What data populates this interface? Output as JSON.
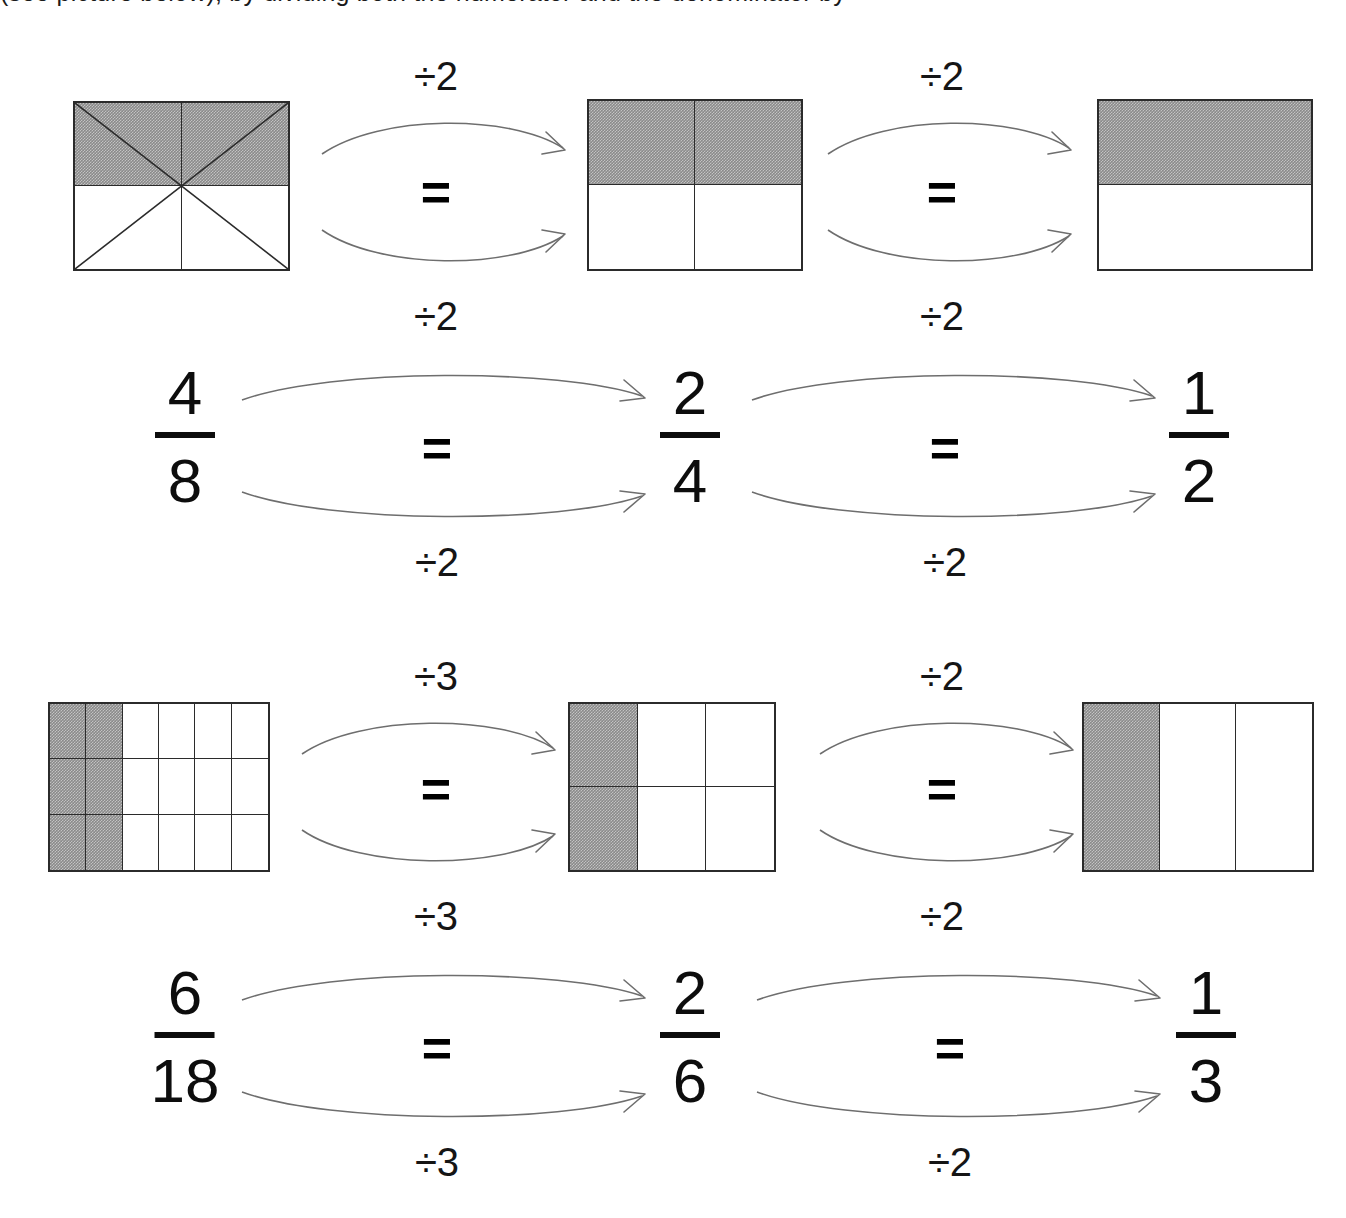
{
  "header": {
    "clipped_text": "(see picture below), by dividing both the numerator and the denominator by"
  },
  "rows": [
    {
      "id": "row-1",
      "shape_models": [
        {
          "name": "eighths-model",
          "fraction_label": "4/8",
          "cols": 2,
          "rows": 2,
          "shaded_cells": [
            0,
            1
          ],
          "diagonals": true,
          "numerator": 4,
          "denominator": 8
        },
        {
          "name": "fourths-model",
          "fraction_label": "2/4",
          "cols": 2,
          "rows": 2,
          "shaded_cells": [
            0,
            1
          ],
          "diagonals": false,
          "numerator": 2,
          "denominator": 4
        },
        {
          "name": "halves-model",
          "fraction_label": "1/2",
          "cols": 1,
          "rows": 2,
          "shaded_cells": [
            0
          ],
          "diagonals": false,
          "numerator": 1,
          "denominator": 2
        }
      ],
      "shape_transitions": [
        {
          "top_label": "÷2",
          "equals": "=",
          "bottom_label": "÷2"
        },
        {
          "top_label": "÷2",
          "equals": "=",
          "bottom_label": "÷2"
        }
      ],
      "fractions": [
        {
          "numerator": "4",
          "denominator": "8"
        },
        {
          "numerator": "2",
          "denominator": "4"
        },
        {
          "numerator": "1",
          "denominator": "2"
        }
      ],
      "fraction_transitions": [
        {
          "top_label": "÷2",
          "equals": "=",
          "bottom_label": "÷2"
        },
        {
          "top_label": "÷2",
          "equals": "=",
          "bottom_label": "÷2"
        }
      ]
    },
    {
      "id": "row-2",
      "shape_models": [
        {
          "name": "eighteenths-model",
          "fraction_label": "6/18",
          "cols": 6,
          "rows": 3,
          "shaded_cols": 2,
          "diagonals": false,
          "numerator": 6,
          "denominator": 18
        },
        {
          "name": "sixths-model",
          "fraction_label": "2/6",
          "cols": 3,
          "rows": 2,
          "shaded_cols": 1,
          "diagonals": false,
          "numerator": 2,
          "denominator": 6
        },
        {
          "name": "thirds-model",
          "fraction_label": "1/3",
          "cols": 3,
          "rows": 1,
          "shaded_cols": 1,
          "diagonals": false,
          "numerator": 1,
          "denominator": 3
        }
      ],
      "shape_transitions": [
        {
          "top_label": "÷3",
          "equals": "=",
          "bottom_label": "÷3"
        },
        {
          "top_label": "÷2",
          "equals": "=",
          "bottom_label": "÷2"
        }
      ],
      "fractions": [
        {
          "numerator": "6",
          "denominator": "18"
        },
        {
          "numerator": "2",
          "denominator": "6"
        },
        {
          "numerator": "1",
          "denominator": "3"
        }
      ],
      "fraction_transitions": [
        {
          "top_label": "÷3",
          "equals": "=",
          "bottom_label": "÷3"
        },
        {
          "top_label": "÷2",
          "equals": "=",
          "bottom_label": "÷2"
        }
      ]
    }
  ],
  "colors": {
    "shaded_fill": "#8a8a8a",
    "outline": "#2b2b2b",
    "arrow": "#6e6e6e",
    "text": "#0d0d0d",
    "background": "#ffffff"
  }
}
